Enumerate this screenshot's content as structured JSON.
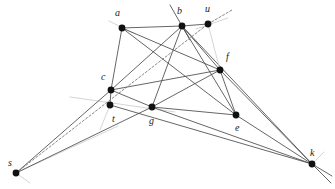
{
  "figure": {
    "type": "geometric-incidence-diagram",
    "width": 335,
    "height": 189,
    "background_color": "#ffffff",
    "vertex_color": "#111111",
    "edge_color": "#4a4a4a",
    "faint_edge_color": "#c9c9c9",
    "dashed_edge_color": "#7a7a7a",
    "label_color": "#1a1a1a",
    "vertex_radius": 3.4
  },
  "vertices": [
    {
      "id": "a",
      "label": "a",
      "x": 122,
      "y": 28,
      "label_x": 115,
      "label_y": 16
    },
    {
      "id": "b",
      "label": "b",
      "x": 182,
      "y": 26,
      "label_x": 177,
      "label_y": 14
    },
    {
      "id": "u",
      "label": "u",
      "x": 208,
      "y": 24,
      "label_x": 205,
      "label_y": 12
    },
    {
      "id": "c",
      "label": "c",
      "x": 111,
      "y": 90,
      "label_x": 101,
      "label_y": 80
    },
    {
      "id": "t",
      "label": "t",
      "x": 110,
      "y": 105,
      "label_x": 112,
      "label_y": 122
    },
    {
      "id": "g",
      "label": "g",
      "x": 152,
      "y": 107,
      "label_x": 149,
      "label_y": 124
    },
    {
      "id": "f",
      "label": "f",
      "x": 220,
      "y": 70,
      "label_x": 226,
      "label_y": 60
    },
    {
      "id": "e",
      "label": "e",
      "x": 236,
      "y": 115,
      "label_x": 235,
      "label_y": 131
    },
    {
      "id": "s",
      "label": "s",
      "x": 16,
      "y": 173,
      "label_x": 8,
      "label_y": 166
    },
    {
      "id": "k",
      "label": "k",
      "x": 312,
      "y": 164,
      "label_x": 310,
      "label_y": 156
    }
  ],
  "edges": [
    {
      "from": "a",
      "to": "b",
      "style": "solid"
    },
    {
      "from": "a",
      "to": "c",
      "style": "solid"
    },
    {
      "from": "a",
      "to": "e",
      "style": "solid"
    },
    {
      "from": "a",
      "to": "f",
      "style": "solid"
    },
    {
      "from": "b",
      "to": "c",
      "style": "solid"
    },
    {
      "from": "b",
      "to": "g",
      "style": "solid"
    },
    {
      "from": "b",
      "to": "e",
      "style": "solid"
    },
    {
      "from": "b",
      "to": "k",
      "style": "solid"
    },
    {
      "from": "b",
      "to": "f",
      "style": "solid"
    },
    {
      "from": "c",
      "to": "g",
      "style": "solid"
    },
    {
      "from": "c",
      "to": "t",
      "style": "solid"
    },
    {
      "from": "c",
      "to": "s",
      "style": "solid"
    },
    {
      "from": "c",
      "to": "f",
      "style": "solid"
    },
    {
      "from": "g",
      "to": "f",
      "style": "solid"
    },
    {
      "from": "g",
      "to": "e",
      "style": "solid"
    },
    {
      "from": "g",
      "to": "k",
      "style": "solid"
    },
    {
      "from": "g",
      "to": "s",
      "style": "solid"
    },
    {
      "from": "f",
      "to": "e",
      "style": "solid"
    },
    {
      "from": "f",
      "to": "k",
      "style": "solid"
    },
    {
      "from": "e",
      "to": "k",
      "style": "solid"
    },
    {
      "from": "t",
      "to": "k",
      "style": "solid"
    },
    {
      "from": "u",
      "to": "b",
      "style": "solid"
    },
    {
      "from": "u",
      "to": "f",
      "style": "faint"
    },
    {
      "from": "s",
      "to": "u",
      "style": "dashed"
    }
  ],
  "extended_lines": [
    {
      "name": "line-through-a",
      "x1": 109,
      "y1": 21,
      "x2": 135,
      "y2": 34,
      "style": "faint"
    },
    {
      "name": "line-through-b",
      "x1": 170,
      "y1": 5,
      "x2": 190,
      "y2": 40,
      "style": "solid"
    },
    {
      "name": "line-through-u",
      "x1": 196,
      "y1": 29,
      "x2": 228,
      "y2": 18,
      "style": "faint"
    },
    {
      "name": "line-through-t",
      "x1": 70,
      "y1": 97,
      "x2": 175,
      "y2": 112,
      "style": "faint"
    },
    {
      "name": "line-t-down",
      "x1": 110,
      "y1": 105,
      "x2": 100,
      "y2": 130,
      "style": "faint"
    },
    {
      "name": "line-s-to-t",
      "x1": 16,
      "y1": 173,
      "x2": 118,
      "y2": 126,
      "style": "faint"
    },
    {
      "name": "dash-extend-u",
      "x1": 208,
      "y1": 24,
      "x2": 232,
      "y2": 10,
      "style": "dashed"
    },
    {
      "name": "k-tail-1",
      "x1": 312,
      "y1": 164,
      "x2": 332,
      "y2": 176,
      "style": "solid"
    },
    {
      "name": "k-tail-2",
      "x1": 312,
      "y1": 164,
      "x2": 331,
      "y2": 183,
      "style": "solid"
    },
    {
      "name": "k-tail-3",
      "x1": 312,
      "y1": 164,
      "x2": 324,
      "y2": 152,
      "style": "faint"
    },
    {
      "name": "s-tail",
      "x1": 16,
      "y1": 173,
      "x2": 30,
      "y2": 183,
      "style": "faint"
    }
  ]
}
